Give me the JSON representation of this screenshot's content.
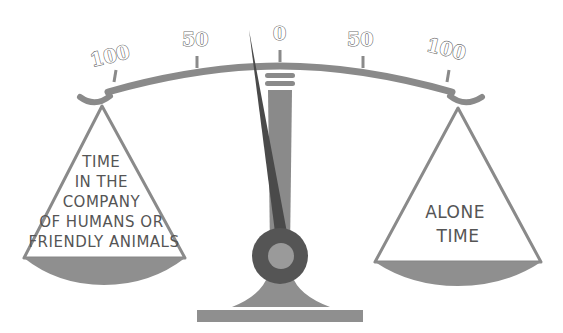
{
  "diagram": {
    "type": "balance-scale",
    "scale_labels": {
      "left_100": "100",
      "left_50": "50",
      "center_0": "0",
      "right_50": "50",
      "right_100": "100"
    },
    "left_pan": {
      "lines": [
        "TIME",
        "IN THE",
        "COMPANY",
        "OF HUMANS OR",
        "FRIENDLY ANIMALS"
      ]
    },
    "right_pan": {
      "lines": [
        "ALONE",
        "TIME"
      ]
    },
    "needle": {
      "direction": "left",
      "approx_value": "slightly left of 0"
    },
    "colors": {
      "beam": "#8a8a8a",
      "pan_fill": "#8f8f8f",
      "needle": "#4a4a4a",
      "post": "#8a8a8a",
      "pivot": "#555555",
      "pivot_inner": "#9a9a9a",
      "base": "#8f8f8f"
    }
  }
}
